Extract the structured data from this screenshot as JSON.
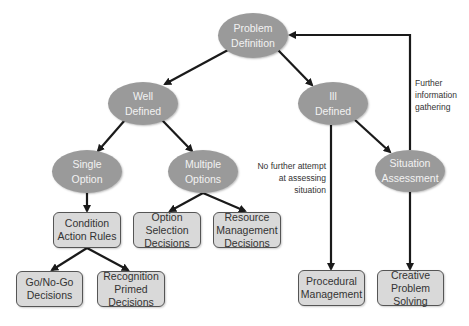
{
  "diagram": {
    "root": "Problem\nDefinition",
    "level1": {
      "well_defined": "Well\nDefined",
      "ill_defined": "Ill\nDefined"
    },
    "level2": {
      "single_option": "Single\nOption",
      "multiple_options": "Multiple\nOptions",
      "situation_assessment": "Situation\nAssessment"
    },
    "decisions": {
      "condition_action_rules": "Condition\nAction Rules",
      "option_selection": "Option\nSelection\nDecisions",
      "resource_management": "Resource\nManagement\nDecisions",
      "go_no_go": "Go/No-Go\nDecisions",
      "recognition_primed": "Recognition\nPrimed\nDecisions",
      "procedural_management": "Procedural\nManagement",
      "creative_problem_solving": "Creative\nProblem\nSolving"
    },
    "annotations": {
      "no_further_attempt": "No further attempt\nat assessing\nsituation",
      "further_information": "Further\ninformation\ngathering"
    },
    "colors": {
      "oval_fill": "#9a9a9a",
      "oval_text": "#f2f2f2",
      "box_fill": "#d9d9d9",
      "box_border": "#555555",
      "edge": "#1a1a1a"
    }
  }
}
